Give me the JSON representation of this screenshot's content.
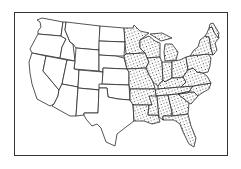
{
  "map": {
    "subject": "Distribution map of the contiguous United States",
    "legend": [],
    "title": "",
    "highlighted_region": {
      "description": "Stippled (dotted) states indicating presence/range in the eastern half of the US",
      "pattern": "stipple-dots",
      "states": [
        "Minnesota",
        "Iowa",
        "Missouri",
        "Arkansas",
        "Louisiana",
        "Wisconsin",
        "Illinois",
        "Michigan",
        "Indiana",
        "Ohio",
        "Kentucky",
        "Tennessee",
        "Mississippi",
        "Alabama",
        "Georgia",
        "Florida",
        "South Carolina",
        "North Carolina",
        "Virginia",
        "West Virginia",
        "Maryland",
        "Delaware",
        "Pennsylvania",
        "New Jersey",
        "New York",
        "Connecticut",
        "Rhode Island",
        "Massachusetts",
        "Vermont",
        "New Hampshire",
        "Maine"
      ]
    },
    "unhighlighted_region": {
      "description": "Western states left blank",
      "states": [
        "Washington",
        "Oregon",
        "California",
        "Idaho",
        "Nevada",
        "Montana",
        "Wyoming",
        "Utah",
        "Arizona",
        "Colorado",
        "New Mexico",
        "North Dakota",
        "South Dakota",
        "Nebraska",
        "Kansas",
        "Oklahoma",
        "Texas"
      ]
    },
    "colors": {
      "line": "#2a2a2a",
      "fill": "#ffffff",
      "dots": "#222222"
    }
  }
}
